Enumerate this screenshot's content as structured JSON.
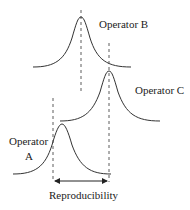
{
  "diagram": {
    "title": "",
    "operators": [
      {
        "id": "B",
        "label": "Operator B"
      },
      {
        "id": "C",
        "label": "Operator C"
      },
      {
        "id": "A",
        "label_line1": "Operator",
        "label_line2": "A"
      }
    ],
    "measurement_label": "Reproducibility",
    "colors": {
      "stroke": "#333333",
      "background": "#ffffff"
    }
  }
}
